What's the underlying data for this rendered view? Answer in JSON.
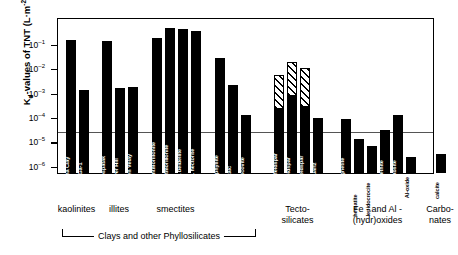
{
  "chart_data": {
    "type": "bar",
    "title": "",
    "xlabel": "",
    "ylabel": "Kd-values of TNT (L·m-2)",
    "ylabel_parts": {
      "pre": "K",
      "sub": "d",
      "mid": "-values of TNT (L·m",
      "sup": "-2",
      "post": ")"
    },
    "yscale": "log",
    "ylim": [
      1e-06,
      1.0
    ],
    "ytick_labels": [
      "10-1",
      "10-2",
      "10-3",
      "10-4",
      "10-5",
      "10-6"
    ],
    "ytick_values": [
      0.1,
      0.01,
      0.001,
      0.0001,
      1e-05,
      1e-06
    ],
    "reference_line": 3e-05,
    "grid": false,
    "legend": "none",
    "categories": [
      "China Clay",
      "KGa-1",
      "Sarospatak",
      "Silver Hill",
      "Puy en Velay",
      "SAz-1 montmorillonite",
      "C.B.montmorillonite",
      "SbCa-1 beidellite",
      "SHCa-1 hectorite",
      "pyrophyllite",
      "talc",
      "muscovite",
      "K/Na-feldspar",
      "K-feldspar",
      "Na-feldspar",
      "quartz",
      "magnetite",
      "hematite",
      "lepidocrocite",
      "goethite",
      "gibbsite",
      "Al-oxide",
      "calcite"
    ],
    "values": [
      0.14,
      0.0013,
      0.13,
      0.0016,
      0.0017,
      0.18,
      0.45,
      0.4,
      0.34,
      0.026,
      0.0021,
      0.00012,
      0.0055,
      0.018,
      0.01,
      9e-05,
      8e-05,
      1.2e-05,
      6.5e-06,
      3e-05,
      0.00012,
      2.2e-06,
      3e-06
    ],
    "hatched_range_top": {
      "12": 0.0055,
      "13": 0.018,
      "14": 0.01
    },
    "hatched_solid_base": {
      "12": 0.00022,
      "13": 0.0007,
      "14": 0.00026
    },
    "groups": [
      {
        "name": "kaolinites",
        "line1": "kaolinites",
        "line2": "",
        "from": 0,
        "to": 1
      },
      {
        "name": "illites",
        "line1": "illites",
        "line2": "",
        "from": 2,
        "to": 4
      },
      {
        "name": "smectites",
        "line1": "smectites",
        "line2": "",
        "from": 5,
        "to": 8
      },
      {
        "name": "tecto-silicates",
        "line1": "Tecto-",
        "line2": "silicates",
        "from": 12,
        "to": 15
      },
      {
        "name": "fe-and-al-hydroxides",
        "line1": "Fe -  and  Al -",
        "line2": "(hydr)oxides",
        "from": 16,
        "to": 21
      },
      {
        "name": "carbonates",
        "line1": "Carbo-",
        "line2": "nates",
        "from": 22,
        "to": 22
      }
    ],
    "bracket_label": "Clays and other Phyllosilicates"
  }
}
